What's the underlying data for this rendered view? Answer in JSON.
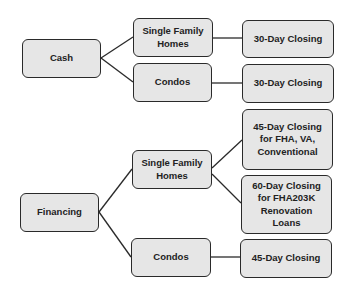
{
  "diagram": {
    "type": "tree",
    "nodes": [
      {
        "id": "cash",
        "label": "Cash"
      },
      {
        "id": "cash_sfh",
        "label": "Single Family\nHomes"
      },
      {
        "id": "cash_condos",
        "label": "Condos"
      },
      {
        "id": "cash_sfh_close",
        "label": "30-Day Closing"
      },
      {
        "id": "cash_condos_close",
        "label": "30-Day Closing"
      },
      {
        "id": "fin",
        "label": "Financing"
      },
      {
        "id": "fin_sfh",
        "label": "Single Family\nHomes"
      },
      {
        "id": "fin_condos",
        "label": "Condos"
      },
      {
        "id": "fin_sfh_close45",
        "label": "45-Day Closing\nfor FHA, VA,\nConventional"
      },
      {
        "id": "fin_sfh_close60",
        "label": "60-Day Closing\nfor FHA203K\nRenovation\nLoans"
      },
      {
        "id": "fin_condos_close",
        "label": "45-Day Closing"
      }
    ],
    "edges": [
      [
        "cash",
        "cash_sfh"
      ],
      [
        "cash",
        "cash_condos"
      ],
      [
        "cash_sfh",
        "cash_sfh_close"
      ],
      [
        "cash_condos",
        "cash_condos_close"
      ],
      [
        "fin",
        "fin_sfh"
      ],
      [
        "fin",
        "fin_condos"
      ],
      [
        "fin_sfh",
        "fin_sfh_close45"
      ],
      [
        "fin_sfh",
        "fin_sfh_close60"
      ],
      [
        "fin_condos",
        "fin_condos_close"
      ]
    ]
  }
}
